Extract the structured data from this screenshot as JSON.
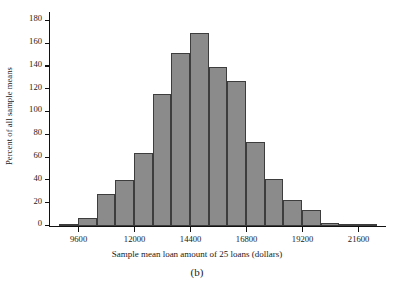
{
  "figure": {
    "caption": "(b)",
    "bar_color": "#8b8b8b",
    "bar_edge_color": "#3d3d3d",
    "axis_color": "#111111"
  },
  "chart_data": {
    "type": "bar",
    "title": "",
    "xlabel": "Sample mean loan amount of 25 loans (dollars)",
    "ylabel": "Percent of all sample means",
    "grid": false,
    "legend": "none",
    "xlim": [
      8400,
      22800
    ],
    "ylim": [
      0,
      188
    ],
    "bin_width": 800,
    "xtick_labels": [
      "9600",
      "12000",
      "14400",
      "16800",
      "19200",
      "21600"
    ],
    "xtick_values": [
      9600,
      12000,
      14400,
      16800,
      19200,
      21600
    ],
    "ytick_labels": [
      "0",
      "20",
      "40",
      "60",
      "80",
      "100",
      "120",
      "140",
      "160",
      "180"
    ],
    "ytick_values": [
      0,
      20,
      40,
      60,
      80,
      100,
      120,
      140,
      160,
      180
    ],
    "bins": [
      {
        "left": 8800,
        "right": 9600,
        "value": 1
      },
      {
        "left": 9600,
        "right": 10400,
        "value": 7
      },
      {
        "left": 10400,
        "right": 11200,
        "value": 28
      },
      {
        "left": 11200,
        "right": 12000,
        "value": 40
      },
      {
        "left": 12000,
        "right": 12800,
        "value": 64
      },
      {
        "left": 12800,
        "right": 13600,
        "value": 116
      },
      {
        "left": 13600,
        "right": 14400,
        "value": 152
      },
      {
        "left": 14400,
        "right": 15200,
        "value": 170
      },
      {
        "left": 15200,
        "right": 16000,
        "value": 140
      },
      {
        "left": 16000,
        "right": 16800,
        "value": 127
      },
      {
        "left": 16800,
        "right": 17600,
        "value": 74
      },
      {
        "left": 17600,
        "right": 18400,
        "value": 41
      },
      {
        "left": 18400,
        "right": 19200,
        "value": 23
      },
      {
        "left": 19200,
        "right": 20000,
        "value": 14
      },
      {
        "left": 20000,
        "right": 20800,
        "value": 3
      },
      {
        "left": 20800,
        "right": 21600,
        "value": 2
      },
      {
        "left": 21600,
        "right": 22400,
        "value": 1
      }
    ]
  }
}
